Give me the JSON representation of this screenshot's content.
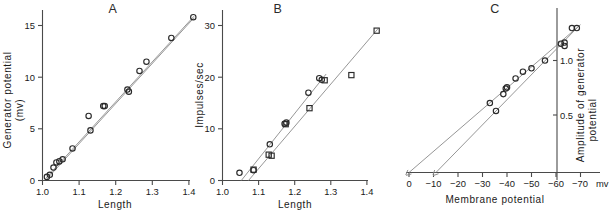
{
  "figure": {
    "background": "#ffffff",
    "ink": "#1a1a1a",
    "line_color": "#8a8a8a",
    "marker_color": "#2a2a2a"
  },
  "panels": [
    {
      "id": "A",
      "title": "A",
      "ylabel_line1": "Generator potential",
      "ylabel_line2": "(mv)",
      "xlabel": "Length",
      "x_ticks": [
        "1.0",
        "1.1",
        "1.2",
        "1.3",
        "1.4"
      ],
      "y_ticks": [
        "0",
        "5",
        "10",
        "15"
      ]
    },
    {
      "id": "B",
      "title": "B",
      "ylabel_line1": "Impulses/sec",
      "ylabel_line2": "",
      "xlabel": "Length",
      "x_ticks": [
        "1.0",
        "1.1",
        "1.2",
        "1.3",
        "1.4"
      ],
      "y_ticks": [
        "0",
        "10",
        "20",
        "30"
      ]
    },
    {
      "id": "C",
      "title": "C",
      "ylabel_line1": "Amplitude of generator",
      "ylabel_line2": "potential",
      "xlabel": "Membrane potential",
      "x_ticks": [
        "0",
        "−10",
        "−20",
        "−30",
        "−40",
        "−50",
        "−60",
        "−70"
      ],
      "x_unit": "mv",
      "y_ticks": [
        "0.5",
        "1.0"
      ]
    }
  ],
  "chart_data": [
    {
      "type": "scatter",
      "panel": "A",
      "title": "A",
      "xlabel": "Length",
      "ylabel": "Generator potential (mv)",
      "xlim": [
        1.0,
        1.44
      ],
      "ylim": [
        0,
        16.4
      ],
      "xticks": [
        1.0,
        1.1,
        1.2,
        1.3,
        1.4
      ],
      "yticks": [
        0,
        5,
        10,
        15
      ],
      "grid": false,
      "legend": "none",
      "series": [
        {
          "name": "series-1-circles",
          "marker": "circle",
          "x": [
            1.012,
            1.02,
            1.03,
            1.038,
            1.046,
            1.055,
            1.082,
            1.126,
            1.131,
            1.166,
            1.17,
            1.232,
            1.236,
            1.265,
            1.284,
            1.352,
            1.412
          ],
          "y": [
            0.35,
            0.55,
            1.25,
            1.75,
            1.85,
            2.05,
            3.1,
            6.25,
            4.85,
            7.2,
            7.2,
            8.8,
            8.6,
            10.6,
            11.5,
            13.8,
            15.8
          ]
        }
      ],
      "fit_lines": [
        {
          "name": "fit-upper",
          "x0": 1.01,
          "y0": 0.25,
          "x1": 1.414,
          "y1": 15.9
        },
        {
          "name": "fit-lower",
          "x0": 1.012,
          "y0": 0.15,
          "x1": 1.414,
          "y1": 15.75
        }
      ]
    },
    {
      "type": "scatter",
      "panel": "B",
      "title": "B",
      "xlabel": "Length",
      "ylabel": "Impulses/sec",
      "xlim": [
        1.0,
        1.44
      ],
      "ylim": [
        0,
        31
      ],
      "xticks": [
        1.0,
        1.1,
        1.2,
        1.3,
        1.4
      ],
      "yticks": [
        0,
        10,
        20,
        30
      ],
      "grid": false,
      "legend": "none",
      "series": [
        {
          "name": "series-1-steep",
          "marker": "circle",
          "x": [
            1.047,
            1.086,
            1.131,
            1.172,
            1.177,
            1.238,
            1.268,
            1.275
          ],
          "y": [
            1.5,
            2.0,
            7.0,
            11.0,
            11.2,
            17.0,
            19.8,
            19.5
          ]
        },
        {
          "name": "series-2-shallow",
          "marker": "square",
          "x": [
            1.086,
            1.128,
            1.136,
            1.175,
            1.241,
            1.283,
            1.357,
            1.427
          ],
          "y": [
            2.1,
            5.0,
            4.8,
            10.9,
            14.0,
            19.4,
            20.4,
            29.0
          ]
        }
      ],
      "fit_lines": [
        {
          "name": "fit-steep",
          "x0": 1.052,
          "y0": 0.0,
          "x1": 1.287,
          "y1": 20.6
        },
        {
          "name": "fit-shallow",
          "x0": 1.072,
          "y0": 0.0,
          "x1": 1.43,
          "y1": 29.3
        }
      ]
    },
    {
      "type": "scatter",
      "panel": "C",
      "title": "C",
      "xlabel": "Membrane potential",
      "ylabel": "Amplitude of generator potential",
      "x_unit": "mv",
      "xlim": [
        0,
        -72
      ],
      "ylim": [
        0,
        1.35
      ],
      "xticks": [
        0,
        -10,
        -20,
        -30,
        -40,
        -50,
        -60,
        -70
      ],
      "yticks": [
        0.5,
        1.0
      ],
      "yaxis_position_mv": -56,
      "grid": false,
      "legend": "none",
      "series": [
        {
          "name": "series-1",
          "marker": "circle",
          "x": [
            -33.0,
            -35.5,
            -38.5,
            -39.5,
            -40.0,
            -43.5,
            -46.5,
            -50.0,
            -55.5,
            -62.0,
            -63.5,
            -63.5,
            -66.5,
            -68.5
          ],
          "y": [
            0.62,
            0.55,
            0.7,
            0.75,
            0.76,
            0.84,
            0.9,
            0.93,
            1.0,
            1.15,
            1.16,
            1.13,
            1.29,
            1.29
          ]
        }
      ],
      "fit_lines": [
        {
          "name": "fit-from-zero",
          "x0": 0.0,
          "y0": 0.0,
          "x1": -70.0,
          "y1": 1.32
        },
        {
          "name": "fit-from-minus-ten",
          "x0": -11.0,
          "y0": 0.0,
          "x1": -69.0,
          "y1": 1.3
        }
      ]
    }
  ]
}
